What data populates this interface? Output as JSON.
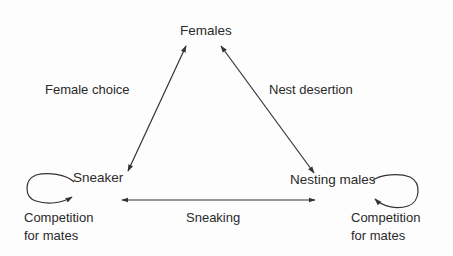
{
  "nodes": {
    "females": "Females",
    "sneaker": "Sneaker",
    "nesting_males": "Nesting males"
  },
  "edges": {
    "female_choice": "Female choice",
    "nest_desertion": "Nest desertion",
    "sneaking": "Sneaking"
  },
  "loops": {
    "left_line1": "Competition",
    "left_line2": "for mates",
    "right_line1": "Competition",
    "right_line2": "for mates"
  },
  "colors": {
    "line": "#333333",
    "text": "#2a2a2a",
    "background": "#fdfdfd"
  }
}
